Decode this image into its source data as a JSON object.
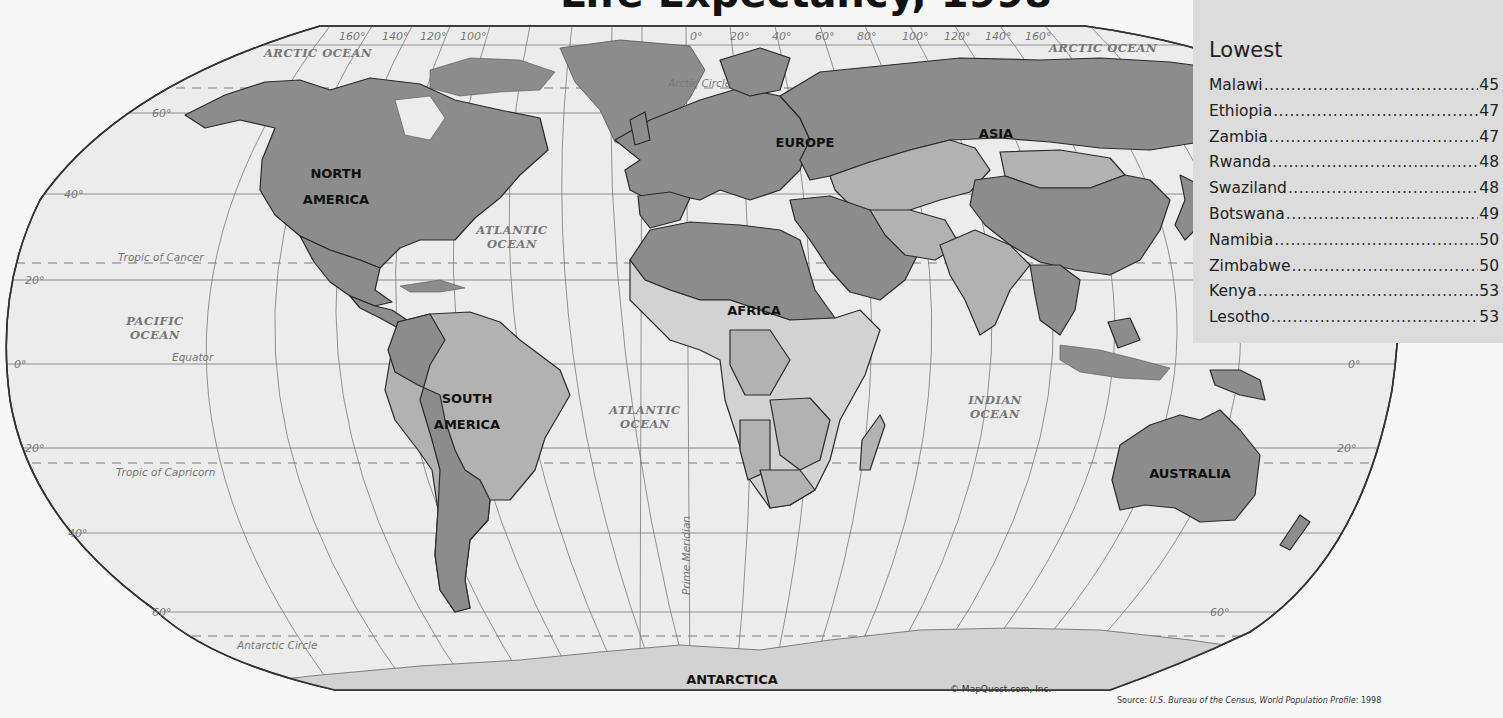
{
  "title": "Life Expectancy, 1998",
  "map": {
    "continents": [
      {
        "label_lines": [
          "NORTH",
          "AMERICA"
        ],
        "x": 336,
        "y": 178
      },
      {
        "label_lines": [
          "SOUTH",
          "AMERICA"
        ],
        "x": 467,
        "y": 403
      },
      {
        "label_lines": [
          "EUROPE"
        ],
        "x": 805,
        "y": 147
      },
      {
        "label_lines": [
          "ASIA"
        ],
        "x": 996,
        "y": 138
      },
      {
        "label_lines": [
          "AFRICA"
        ],
        "x": 754,
        "y": 315
      },
      {
        "label_lines": [
          "AUSTRALIA"
        ],
        "x": 1190,
        "y": 478
      },
      {
        "label_lines": [
          "ANTARCTICA"
        ],
        "x": 732,
        "y": 684
      }
    ],
    "oceans": [
      {
        "label_lines": [
          "ARCTIC OCEAN"
        ],
        "x": 318,
        "y": 57
      },
      {
        "label_lines": [
          "ARCTIC OCEAN"
        ],
        "x": 1103,
        "y": 52
      },
      {
        "label_lines": [
          "ATLANTIC",
          "OCEAN"
        ],
        "x": 512,
        "y": 234
      },
      {
        "label_lines": [
          "PACIFIC",
          "OCEAN"
        ],
        "x": 155,
        "y": 325
      },
      {
        "label_lines": [
          "ATLANTIC",
          "OCEAN"
        ],
        "x": 645,
        "y": 414
      },
      {
        "label_lines": [
          "INDIAN",
          "OCEAN"
        ],
        "x": 995,
        "y": 404
      }
    ],
    "reference_lines": {
      "arctic_circle": "Arctic Circle",
      "tropic_of_cancer": "Tropic of Cancer",
      "equator": "Equator",
      "tropic_of_capricorn": "Tropic of Capricorn",
      "antarctic_circle": "Antarctic Circle",
      "prime_meridian": "Prime Meridian"
    },
    "longitude_labels_west": [
      "160°",
      "140°",
      "120°",
      "100°"
    ],
    "longitude_labels_east": [
      "0°",
      "20°",
      "40°",
      "60°",
      "80°",
      "100°",
      "120°",
      "140°",
      "160°"
    ],
    "latitude_labels": [
      "60°",
      "40°",
      "20°",
      "0°",
      "20°",
      "40°",
      "60°"
    ],
    "copyright": "© MapQuest.com, Inc.",
    "colors": {
      "ocean": "#ececec",
      "land_light": "#d2d2d2",
      "land_medium": "#b2b2b2",
      "land_dark": "#8c8c8c",
      "border": "#2a2a2a",
      "grid": "#7a7a7a"
    }
  },
  "legend": {
    "heading": "Lowest",
    "items": [
      {
        "country": "Malawi",
        "value": "45"
      },
      {
        "country": "Ethiopia",
        "value": "47"
      },
      {
        "country": "Zambia",
        "value": "47"
      },
      {
        "country": "Rwanda",
        "value": "48"
      },
      {
        "country": "Swaziland",
        "value": "48"
      },
      {
        "country": "Botswana",
        "value": "49"
      },
      {
        "country": "Namibia",
        "value": "50"
      },
      {
        "country": "Zimbabwe",
        "value": "50"
      },
      {
        "country": "Kenya",
        "value": "53"
      },
      {
        "country": "Lesotho",
        "value": "53"
      }
    ]
  },
  "source": {
    "prefix": "Source: ",
    "italic": "U.S. Bureau of the Census, World Population Profile",
    "suffix": ": 1998"
  }
}
